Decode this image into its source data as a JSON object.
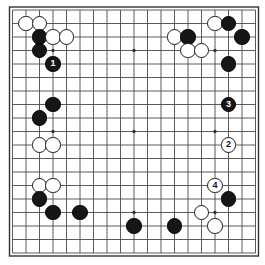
{
  "diagram": {
    "kind": "go-board-diagram",
    "board_size": 19,
    "colors": {
      "background": "#ffffff",
      "board": "#ffffff",
      "line": "#4a4a4a",
      "border": "#333333",
      "black_stone": "#161616",
      "white_stone": "#ffffff",
      "white_stone_border": "#1a1a1a",
      "black_label_text": "#ffffff",
      "white_label_text": "#111111"
    },
    "geometry": {
      "origin_x": 12.5,
      "origin_y": 10.0,
      "spacing": 13.5,
      "stone_diameter": 15.5,
      "border_padding": 3.0
    },
    "star_points": [
      {
        "col": 4,
        "row": 4
      },
      {
        "col": 10,
        "row": 4
      },
      {
        "col": 16,
        "row": 4
      },
      {
        "col": 4,
        "row": 10
      },
      {
        "col": 10,
        "row": 10
      },
      {
        "col": 16,
        "row": 10
      },
      {
        "col": 4,
        "row": 16
      },
      {
        "col": 10,
        "row": 16
      },
      {
        "col": 16,
        "row": 16
      }
    ],
    "stones": [
      {
        "id": "w-c2r2",
        "color": "white",
        "col": 2,
        "row": 2,
        "label": ""
      },
      {
        "id": "w-c3r2",
        "color": "white",
        "col": 3,
        "row": 2,
        "label": ""
      },
      {
        "id": "b-c3r3",
        "color": "black",
        "col": 3,
        "row": 3,
        "label": ""
      },
      {
        "id": "w-c4r3",
        "color": "white",
        "col": 4,
        "row": 3,
        "label": ""
      },
      {
        "id": "w-c5r3",
        "color": "white",
        "col": 5,
        "row": 3,
        "label": ""
      },
      {
        "id": "b-c3r4",
        "color": "black",
        "col": 3,
        "row": 4,
        "label": ""
      },
      {
        "id": "b-c4r5",
        "color": "black",
        "col": 4,
        "row": 5,
        "label": "1"
      },
      {
        "id": "w-c13r3",
        "color": "white",
        "col": 13,
        "row": 3,
        "label": ""
      },
      {
        "id": "b-c14r3",
        "color": "black",
        "col": 14,
        "row": 3,
        "label": ""
      },
      {
        "id": "w-c16r2",
        "color": "white",
        "col": 16,
        "row": 2,
        "label": ""
      },
      {
        "id": "b-c17r2",
        "color": "black",
        "col": 17,
        "row": 2,
        "label": ""
      },
      {
        "id": "b-c18r3",
        "color": "black",
        "col": 18,
        "row": 3,
        "label": ""
      },
      {
        "id": "w-c14r4",
        "color": "white",
        "col": 14,
        "row": 4,
        "label": ""
      },
      {
        "id": "w-c15r4",
        "color": "white",
        "col": 15,
        "row": 4,
        "label": ""
      },
      {
        "id": "b-c17r5",
        "color": "black",
        "col": 17,
        "row": 5,
        "label": ""
      },
      {
        "id": "b-c4r8",
        "color": "black",
        "col": 4,
        "row": 8,
        "label": ""
      },
      {
        "id": "b-c3r9",
        "color": "black",
        "col": 3,
        "row": 9,
        "label": ""
      },
      {
        "id": "w-c3r11",
        "color": "white",
        "col": 3,
        "row": 11,
        "label": ""
      },
      {
        "id": "w-c4r11",
        "color": "white",
        "col": 4,
        "row": 11,
        "label": ""
      },
      {
        "id": "b-c17r8",
        "color": "black",
        "col": 17,
        "row": 8,
        "label": "3"
      },
      {
        "id": "w-c17r11",
        "color": "white",
        "col": 17,
        "row": 11,
        "label": "2"
      },
      {
        "id": "w-c3r14",
        "color": "white",
        "col": 3,
        "row": 14,
        "label": ""
      },
      {
        "id": "w-c4r14",
        "color": "white",
        "col": 4,
        "row": 14,
        "label": ""
      },
      {
        "id": "b-c3r15",
        "color": "black",
        "col": 3,
        "row": 15,
        "label": ""
      },
      {
        "id": "b-c4r16",
        "color": "black",
        "col": 4,
        "row": 16,
        "label": ""
      },
      {
        "id": "b-c6r16",
        "color": "black",
        "col": 6,
        "row": 16,
        "label": ""
      },
      {
        "id": "w-c16r14",
        "color": "white",
        "col": 16,
        "row": 14,
        "label": "4"
      },
      {
        "id": "b-c17r15",
        "color": "black",
        "col": 17,
        "row": 15,
        "label": ""
      },
      {
        "id": "w-c15r16",
        "color": "white",
        "col": 15,
        "row": 16,
        "label": ""
      },
      {
        "id": "w-c16r17",
        "color": "white",
        "col": 16,
        "row": 17,
        "label": ""
      },
      {
        "id": "b-c10r17",
        "color": "black",
        "col": 10,
        "row": 17,
        "label": ""
      },
      {
        "id": "b-c13r17",
        "color": "black",
        "col": 13,
        "row": 17,
        "label": ""
      }
    ]
  }
}
